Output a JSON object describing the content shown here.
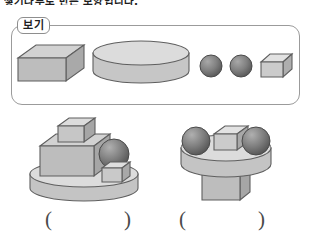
{
  "worksheet": {
    "top_prompt": "쌓기나무로 만든 모양입니다.",
    "example_label": "보기",
    "background_color": "#ffffff",
    "border_color": "#9b9b9b"
  },
  "palette": {
    "solid_light": "#d9d9d9",
    "solid_mid": "#bfbfbf",
    "solid_dark": "#a6a6a6",
    "sphere_light": "#9a9a9a",
    "sphere_dark": "#5d5d5d",
    "outline": "#5a5a5a",
    "text": "#2b2b2b"
  },
  "example_shapes": [
    {
      "name": "rectangular-prism",
      "label": "직육면체",
      "fill": "#bfbfbf"
    },
    {
      "name": "cylinder",
      "label": "원기둥",
      "fill": "#cfcfcf"
    },
    {
      "name": "sphere-a",
      "label": "구",
      "fill": "#7a7a7a"
    },
    {
      "name": "sphere-b",
      "label": "구",
      "fill": "#7a7a7a"
    },
    {
      "name": "small-cube",
      "label": "정육면체",
      "fill": "#d4d4d4"
    }
  ],
  "figures": [
    {
      "id": "figure-left",
      "name": "composite-figure-left",
      "description": "원기둥 위에 직육면체와 정육면체, 구를 쌓은 모양",
      "parts": [
        "cylinder-base",
        "large-cuboid",
        "small-cube-top",
        "sphere",
        "small-cube-right"
      ]
    },
    {
      "id": "figure-right",
      "name": "composite-figure-right",
      "description": "직육면체 위에 원기둥을 올리고 구 2개와 정육면체를 올린 모양",
      "parts": [
        "cuboid-base",
        "cylinder",
        "sphere-left",
        "cube-middle",
        "sphere-right"
      ]
    }
  ],
  "answers": [
    {
      "id": "answer-left",
      "open": "(",
      "close": ")",
      "value": ""
    },
    {
      "id": "answer-right",
      "open": "(",
      "close": ")",
      "value": ""
    }
  ]
}
